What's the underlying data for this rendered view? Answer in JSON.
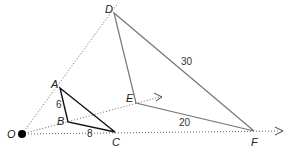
{
  "diagram": {
    "center": {
      "label": "O",
      "x": 22,
      "y": 134
    },
    "small_triangle": {
      "vertices": [
        {
          "label": "A",
          "x": 60,
          "y": 88
        },
        {
          "label": "B",
          "x": 68,
          "y": 122
        },
        {
          "label": "C",
          "x": 115,
          "y": 132
        }
      ],
      "side_labels": {
        "AB": "6",
        "BC": "8"
      }
    },
    "large_triangle": {
      "vertices": [
        {
          "label": "D",
          "x": 114,
          "y": 13
        },
        {
          "label": "E",
          "x": 136,
          "y": 103
        },
        {
          "label": "F",
          "x": 254,
          "y": 131
        }
      ],
      "side_labels": {
        "DF": "30",
        "EF": "20"
      }
    },
    "labels": {
      "O": "O",
      "A": "A",
      "B": "B",
      "C": "C",
      "D": "D",
      "E": "E",
      "F": "F",
      "AB": "6",
      "BC": "8",
      "DF": "30",
      "EF": "20"
    }
  }
}
